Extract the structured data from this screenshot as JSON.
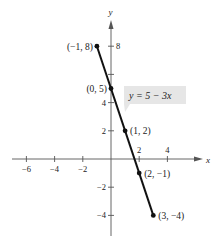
{
  "chart_data": {
    "type": "line",
    "title": "",
    "xlabel": "x",
    "ylabel": "y",
    "equation_label": "y = 5 − 3x",
    "xlim": [
      -7,
      5
    ],
    "ylim": [
      -5,
      9
    ],
    "x_ticks": [
      -6,
      -4,
      -2,
      2,
      4
    ],
    "x_tick_labels": [
      "−6",
      "−4",
      "−2",
      "2",
      "4"
    ],
    "y_ticks": [
      -4,
      -2,
      2,
      4,
      8
    ],
    "y_tick_labels": [
      "−4",
      "−2",
      "2",
      "4",
      "8"
    ],
    "y_unlabeled_ticks": [
      6
    ],
    "grid": false,
    "series": [
      {
        "name": "y = 5 − 3x",
        "x": [
          -1,
          0,
          1,
          2,
          3
        ],
        "y": [
          8,
          5,
          2,
          -1,
          -4
        ]
      }
    ],
    "point_labels": [
      "(−1, 8)",
      "(0, 5)",
      "(1, 2)",
      "(2, −1)",
      "(3, −4)"
    ],
    "colors": {
      "line": "#111111",
      "axis": "#555555",
      "label_box": "#e6e6e6"
    }
  }
}
